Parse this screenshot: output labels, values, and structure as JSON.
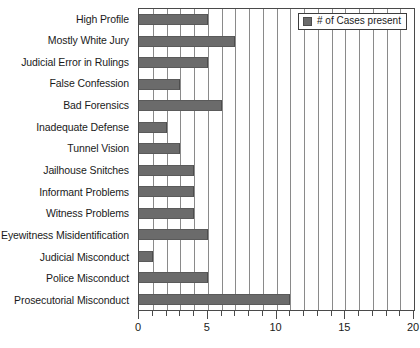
{
  "chart_data": {
    "type": "bar",
    "orientation": "horizontal",
    "title": "",
    "xlabel": "",
    "ylabel": "",
    "xlim": [
      0,
      20
    ],
    "xticks": [
      "0",
      "5",
      "10",
      "15",
      "20"
    ],
    "xtick_values": [
      0,
      5,
      10,
      15,
      20
    ],
    "minor_tick_step": 1,
    "grid": "vertical",
    "legend_position": "top-right",
    "legend": [
      "# of Cases present"
    ],
    "series_name": "# of Cases present",
    "bar_color": "#6b6b6b",
    "plot_border_color": "#4a4a4a",
    "grid_color": "#8a8a8a",
    "categories": [
      "High Profile",
      "Mostly White Jury",
      "Judicial Error in Rulings",
      "False Confession",
      "Bad Forensics",
      "Inadequate Defense",
      "Tunnel Vision",
      "Jailhouse Snitches",
      "Informant Problems",
      "Witness Problems",
      "Eyewitness Misidentification",
      "Judicial Misconduct",
      "Police Misconduct",
      "Prosecutorial Misconduct"
    ],
    "values": [
      5,
      7,
      5,
      3,
      6,
      2,
      3,
      4,
      4,
      4,
      5,
      1,
      5,
      11
    ],
    "series": [
      {
        "name": "# of Cases present",
        "values": [
          5,
          7,
          5,
          3,
          6,
          2,
          3,
          4,
          4,
          4,
          5,
          1,
          5,
          11
        ]
      }
    ]
  }
}
